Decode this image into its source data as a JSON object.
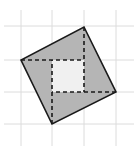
{
  "diagram": {
    "type": "tilted-square-on-grid",
    "colors": {
      "background": "#ffffff",
      "grid": "#dcdcdc",
      "outer_fill": "#b5b5b5",
      "inner_fill": "#f0f0f0",
      "stroke": "#1a1a1a"
    },
    "grid": {
      "vertical_x": [
        21,
        52,
        84,
        116
      ],
      "horizontal_y": [
        26,
        60,
        92,
        124
      ],
      "x_extent": [
        4,
        134
      ],
      "y_extent": [
        10,
        146
      ]
    },
    "outer_square": {
      "vertices": [
        [
          84,
          27
        ],
        [
          116,
          92
        ],
        [
          52,
          124
        ],
        [
          21,
          60
        ]
      ],
      "points": "84,27 116,92 52,124 21,60"
    },
    "inner_square": {
      "x": 52,
      "y": 60,
      "width": 32,
      "height": 32
    },
    "dashed_segments": [
      {
        "name": "top-vertex-down",
        "x1": 84,
        "y1": 27,
        "x2": 84,
        "y2": 92
      },
      {
        "name": "right-vertex-left",
        "x1": 116,
        "y1": 92,
        "x2": 52,
        "y2": 92
      },
      {
        "name": "bottom-vertex-up",
        "x1": 52,
        "y1": 124,
        "x2": 52,
        "y2": 60
      },
      {
        "name": "left-vertex-right",
        "x1": 21,
        "y1": 60,
        "x2": 84,
        "y2": 60
      }
    ]
  }
}
